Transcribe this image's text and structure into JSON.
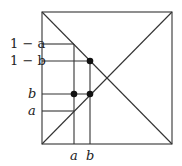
{
  "diagram": {
    "labels": {
      "one_minus_a": "1 − a",
      "one_minus_b": "1 − b",
      "b_left": "b",
      "a_left": "a",
      "a_bottom": "a",
      "b_bottom": "b"
    },
    "colors": {
      "line": "#333333",
      "dot": "#111111"
    }
  }
}
